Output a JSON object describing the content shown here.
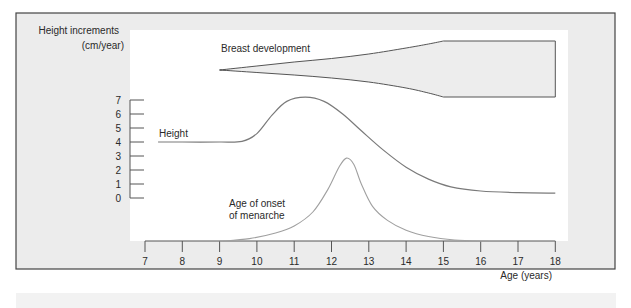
{
  "chart_data": {
    "type": "line",
    "title": "",
    "ylabel": "Height increments (cm/year)",
    "ylabel_lines": [
      "Height increments",
      "(cm/year)"
    ],
    "xlabel": "Age (years)",
    "x_ticks": [
      7,
      8,
      9,
      10,
      11,
      12,
      13,
      14,
      15,
      16,
      17,
      18
    ],
    "y_ticks": [
      0,
      1,
      2,
      3,
      4,
      5,
      6,
      7
    ],
    "xlim": [
      7,
      18
    ],
    "ylim": [
      0,
      7
    ],
    "grid": false,
    "legend": "inline labels",
    "series": [
      {
        "name": "Height",
        "label": "Height",
        "unit": "cm/year",
        "x": [
          7.35,
          8,
          9,
          9.6,
          10,
          10.4,
          10.8,
          11.3,
          11.8,
          12.3,
          12.8,
          13.4,
          14,
          14.6,
          15.2,
          16,
          17,
          18
        ],
        "y": [
          4.0,
          4.0,
          4.0,
          4.05,
          4.6,
          5.9,
          6.9,
          7.2,
          6.9,
          6.0,
          4.8,
          3.4,
          2.2,
          1.35,
          0.8,
          0.5,
          0.38,
          0.35
        ]
      },
      {
        "name": "Age of onset of menarche",
        "label_lines": [
          "Age of onset",
          "of menarche"
        ],
        "unit": "relative frequency",
        "x": [
          9,
          9.8,
          10.5,
          11,
          11.5,
          11.9,
          12.2,
          12.4,
          12.6,
          12.8,
          13.1,
          13.5,
          14,
          14.6,
          15.3,
          16.2
        ],
        "y": [
          -3.1,
          -2.9,
          -2.5,
          -2.0,
          -1.0,
          0.6,
          2.2,
          2.85,
          2.4,
          1.0,
          -0.6,
          -1.6,
          -2.3,
          -2.75,
          -3.0,
          -3.1
        ]
      },
      {
        "name": "Breast development",
        "label": "Breast development",
        "type": "band",
        "x": [
          9,
          10,
          11,
          12,
          13,
          14,
          14.6,
          15,
          18
        ],
        "upper_px_offset": [
          0,
          4,
          8,
          11.5,
          16,
          22,
          26,
          29,
          29
        ],
        "lower_px_offset": [
          0,
          2.5,
          5,
          8,
          12,
          18,
          23,
          27,
          27
        ]
      }
    ]
  },
  "layout": {
    "frame": {
      "x": 16,
      "y": 13,
      "w": 599,
      "h": 256,
      "fill": "#ececec",
      "stroke": "#444444"
    },
    "plot_white": {
      "x": 130,
      "y": 30,
      "w": 438,
      "h": 211
    },
    "x_axis": {
      "y": 241,
      "x0_px": 145,
      "px_per_year": 37.3,
      "tick_len": 11
    },
    "y_axis": {
      "x": 130,
      "y0_px": 198,
      "px_per_unit": 14,
      "tick_len": 14
    },
    "breast_axis_y": 70,
    "colors": {
      "text": "#2a2a2a",
      "axis": "#555555",
      "height_line": "#7a7a7a",
      "menarche_line": "#a0a0a0",
      "band_fill": "#ededed",
      "band_stroke": "#555555"
    }
  }
}
